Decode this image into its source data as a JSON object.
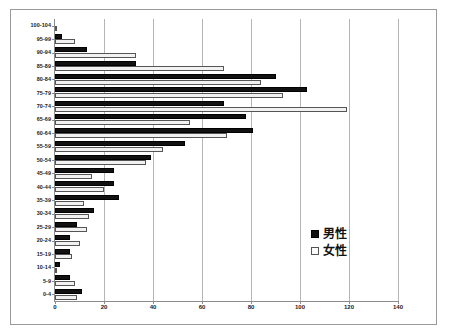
{
  "chart_data": {
    "type": "bar",
    "orientation": "horizontal",
    "title": "",
    "xlabel": "",
    "ylabel": "",
    "xlim": [
      0,
      140
    ],
    "xticks": [
      0,
      20,
      40,
      60,
      80,
      100,
      120,
      140
    ],
    "grid": "vertical",
    "legend_position": "right",
    "categories": [
      "100-104",
      "95-99",
      "90-94",
      "85-89",
      "80-84",
      "75-79",
      "70-74",
      "65-69",
      "60-64",
      "55-59",
      "50-54",
      "45-49",
      "40-44",
      "35-39",
      "30-34",
      "25-29",
      "20-24",
      "15-19",
      "10-14",
      "5-9",
      "0-4"
    ],
    "series": [
      {
        "name": "男性",
        "color": "#111111",
        "values": [
          0,
          3,
          13,
          33,
          90,
          103,
          69,
          78,
          81,
          53,
          39,
          24,
          24,
          26,
          16,
          9,
          6,
          6,
          2,
          6,
          11
        ]
      },
      {
        "name": "女性",
        "color": "#f2f2f2",
        "values": [
          1,
          8,
          33,
          69,
          84,
          93,
          119,
          55,
          70,
          44,
          37,
          15,
          20,
          12,
          14,
          13,
          10,
          7,
          1,
          8,
          9
        ]
      }
    ]
  },
  "legend": {
    "items": [
      {
        "label": "男性"
      },
      {
        "label": "女性"
      }
    ]
  }
}
